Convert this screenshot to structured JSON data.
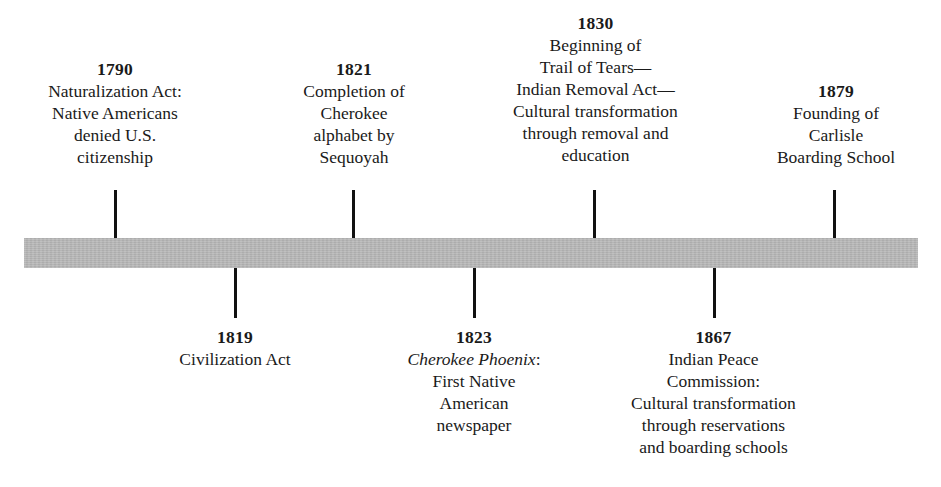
{
  "figure": {
    "type": "timeline",
    "orientation": "horizontal",
    "bar_color": "#b4b4b4",
    "tick_color": "#111111",
    "background_color": "#ffffff"
  },
  "events_above": [
    {
      "year": "1790",
      "description": "Naturalization Act:\nNative Americans\ndenied U.S.\ncitizenship",
      "position_x": 115
    },
    {
      "year": "1821",
      "description": "Completion of\nCherokee\nalphabet by\nSequoyah",
      "position_x": 353
    },
    {
      "year": "1830",
      "description": "Beginning of\nTrail of Tears—\nIndian Removal Act—\nCultural transformation\nthrough removal and\neducation",
      "position_x": 594
    },
    {
      "year": "1879",
      "description": "Founding of\nCarlisle\nBoarding School",
      "position_x": 834
    }
  ],
  "events_below": [
    {
      "year": "1819",
      "description": "Civilization Act",
      "position_x": 235
    },
    {
      "year": "1823",
      "title_italic": "Cherokee Phoenix",
      "description_after_title": ":\nFirst Native\nAmerican\nnewspaper",
      "position_x": 474
    },
    {
      "year": "1867",
      "description": "Indian Peace\nCommission:\nCultural transformation\nthrough reservations\nand boarding schools",
      "position_x": 714
    }
  ]
}
